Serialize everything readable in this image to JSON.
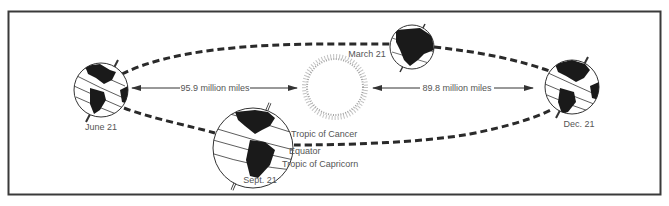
{
  "diagram": {
    "type": "earth-orbit-seasons",
    "sun": {
      "label": ""
    },
    "positions": [
      {
        "id": "june",
        "label": "June 21"
      },
      {
        "id": "march",
        "label": "March 21"
      },
      {
        "id": "sept",
        "label": "Sept. 21"
      },
      {
        "id": "dec",
        "label": "Dec. 21"
      }
    ],
    "distances": {
      "aphelion": "95.9 million miles",
      "perihelion": "89.8 million miles"
    },
    "latitude_labels": {
      "cancer": "Tropic of Cancer",
      "equator": "Equator",
      "capricorn": "Tropic of Capricorn"
    },
    "colors": {
      "frame": "#3a3a3a",
      "orbit": "#2a2a2a",
      "land": "#1a1a1a",
      "text": "#555555"
    }
  }
}
